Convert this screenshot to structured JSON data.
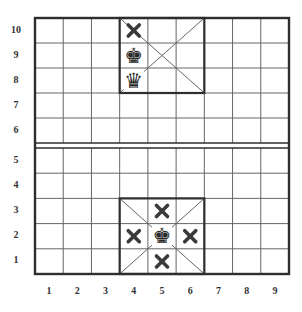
{
  "diagram": {
    "board": {
      "columns": 9,
      "rows": 10,
      "river_between_rows": [
        5,
        6
      ]
    },
    "row_labels": [
      "10",
      "9",
      "8",
      "7",
      "6",
      "5",
      "4",
      "3",
      "2",
      "1"
    ],
    "column_labels": [
      "1",
      "2",
      "3",
      "4",
      "5",
      "6",
      "7",
      "8",
      "9"
    ],
    "palaces": [
      {
        "name": "top-palace",
        "columns": [
          4,
          6
        ],
        "rows": [
          8,
          10
        ]
      },
      {
        "name": "bottom-palace",
        "columns": [
          4,
          6
        ],
        "rows": [
          1,
          3
        ]
      }
    ],
    "pieces": [
      {
        "type": "x-mark",
        "col": 4,
        "row": 10
      },
      {
        "type": "king",
        "col": 4,
        "row": 9
      },
      {
        "type": "queen",
        "col": 4,
        "row": 8
      },
      {
        "type": "x-mark",
        "col": 5,
        "row": 3
      },
      {
        "type": "x-mark",
        "col": 4,
        "row": 2
      },
      {
        "type": "king",
        "col": 5,
        "row": 2
      },
      {
        "type": "x-mark",
        "col": 6,
        "row": 2
      },
      {
        "type": "x-mark",
        "col": 5,
        "row": 1
      }
    ],
    "colors": {
      "line": "#666666",
      "border": "#2e2e2e",
      "piece": "#2a2a2a",
      "mark": "#3a3a3a"
    }
  }
}
